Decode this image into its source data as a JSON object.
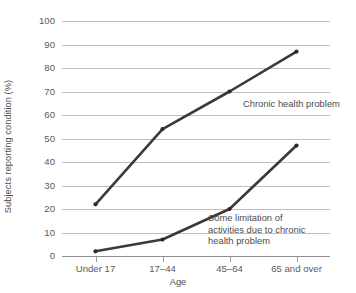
{
  "chart_data": {
    "type": "line",
    "title": "",
    "subtitle": "",
    "xlabel": "Age",
    "ylabel": "Subjects reporting condition (%)",
    "categories": [
      "Under 17",
      "17–44",
      "45–64",
      "65 and over"
    ],
    "series": [
      {
        "name": "Chronic health problem",
        "values": [
          22,
          54,
          70,
          87
        ],
        "color": "#3a3a3a",
        "annotation": "Chronic health problem"
      },
      {
        "name": "Some limitation of activities due to chronic health problem",
        "values": [
          2,
          7,
          20,
          47
        ],
        "color": "#3a3a3a",
        "annotation": "Some limitation of\nactivities due to chronic\nhealth problem"
      }
    ],
    "ylim": [
      0,
      100
    ],
    "y_ticks": [
      0,
      10,
      20,
      30,
      40,
      50,
      60,
      70,
      80,
      90,
      100
    ],
    "y_tick_labels": [
      "0",
      "10",
      "20",
      "30",
      "40",
      "50",
      "60",
      "70",
      "80",
      "90",
      "100"
    ],
    "grid": "horizontal",
    "legend": "inline-annotations",
    "legend_position": "none",
    "background": "#ffffff",
    "gridline_color": "#bfbfbf",
    "axis_color": "#8c8c8c",
    "text_color": "#4d4d4d"
  }
}
